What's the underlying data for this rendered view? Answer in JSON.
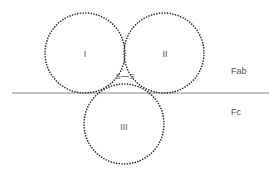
{
  "diagram": {
    "domains": [
      {
        "id": "I",
        "label": "I",
        "cx": 85,
        "cy": 53,
        "r": 40
      },
      {
        "id": "II",
        "label": "II",
        "cx": 164,
        "cy": 53,
        "r": 40
      },
      {
        "id": "III",
        "label": "III",
        "cx": 124,
        "cy": 124,
        "r": 40
      }
    ],
    "bond": {
      "label": "S—S",
      "left": "S",
      "right": "S"
    },
    "divider": {
      "x1": 12,
      "x2": 269,
      "y": 93
    },
    "regions": {
      "upper": "Fab",
      "lower": "Fc"
    },
    "colors": {
      "dots": "#2a2a2a",
      "line": "#888888",
      "text": "#555555"
    }
  }
}
